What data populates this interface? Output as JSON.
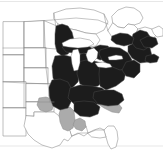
{
  "figure": {
    "type": "choropleth-range-map",
    "width_px": 163,
    "height_px": 154,
    "background_color": "#ffffff",
    "projection_region": "Eastern and Central North America"
  },
  "legend": {
    "visible": false,
    "categories": [
      {
        "key": "core",
        "label": "Core range",
        "color": "#1c1c1c",
        "fill_style": "solid-dark"
      },
      {
        "key": "peripheral",
        "label": "Peripheral range",
        "color": "#ababab",
        "fill_style": "solid-gray"
      },
      {
        "key": "absent",
        "label": "Absent",
        "color": "#ffffff",
        "fill_style": "outline-only"
      }
    ]
  },
  "map": {
    "outline_stroke_color": "#8a8a8a",
    "core_fill_color": "#1c1c1c",
    "peripheral_fill_color": "#ababab",
    "absent_fill_color": "#ffffff",
    "lake_fill_color": "#ffffff",
    "regions": {
      "core_dark": [
        "Minnesota (east)",
        "Wisconsin",
        "Michigan",
        "Iowa",
        "Missouri",
        "Illinois",
        "Indiana",
        "Ohio",
        "Kentucky",
        "Tennessee",
        "West Virginia",
        "Virginia",
        "Pennsylvania",
        "New York",
        "New Jersey",
        "Maryland",
        "Delaware",
        "Connecticut",
        "Rhode Island",
        "Massachusetts",
        "Vermont",
        "New Hampshire",
        "Maine",
        "North Carolina (west)",
        "South Carolina (north)",
        "Georgia (north)",
        "Alabama (north)",
        "Arkansas (north)",
        "Southern Ontario",
        "Southern Quebec",
        "New Brunswick",
        "Nova Scotia"
      ],
      "peripheral_gray": [
        "Oklahoma (east)",
        "Kansas (southeast)",
        "Mississippi",
        "Alabama (south)",
        "Louisiana (north)",
        "South Carolina (coastal)",
        "Georgia (coastal)",
        "North Carolina (coastal)"
      ],
      "absent_white": [
        "Montana",
        "Wyoming",
        "Colorado",
        "New Mexico",
        "North Dakota",
        "South Dakota",
        "Nebraska",
        "Kansas (west)",
        "Oklahoma (west)",
        "Texas",
        "Florida",
        "Northern Ontario",
        "Northern Quebec"
      ],
      "water_bodies": [
        "Lake Superior",
        "Lake Michigan",
        "Lake Huron",
        "Lake Erie",
        "Lake Ontario",
        "Atlantic Ocean",
        "Gulf of Mexico"
      ]
    }
  },
  "annotations": {
    "text_labels": [],
    "scale_bar": null,
    "north_arrow": null,
    "caption": ""
  }
}
